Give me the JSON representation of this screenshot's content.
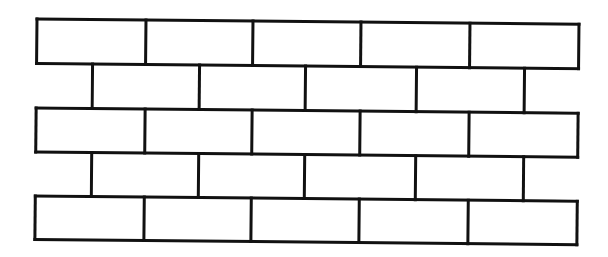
{
  "diagram": {
    "type": "brick-wall-pattern",
    "stroke_color": "#111111",
    "background_color": "#ffffff",
    "wall": {
      "left_x": 37,
      "right_x": 579,
      "course_edges_y": [
        19,
        63.5,
        108,
        152,
        196,
        239.5
      ],
      "tilt_deg": 0.55
    },
    "courses": [
      {
        "index": 1,
        "kind": "full",
        "dividers_x": [
          146,
          253,
          361,
          470
        ],
        "brick_count": 5
      },
      {
        "index": 2,
        "kind": "offset",
        "dividers_x": [
          93,
          200,
          306,
          417,
          525
        ],
        "brick_count": 4
      },
      {
        "index": 3,
        "kind": "full",
        "dividers_x": [
          146,
          253,
          361,
          470
        ],
        "brick_count": 5
      },
      {
        "index": 4,
        "kind": "offset",
        "dividers_x": [
          93,
          200,
          306,
          417,
          525
        ],
        "brick_count": 4
      },
      {
        "index": 5,
        "kind": "full",
        "dividers_x": [
          146,
          253,
          361,
          470
        ],
        "brick_count": 5
      }
    ]
  }
}
